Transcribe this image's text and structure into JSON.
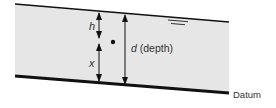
{
  "diagram": {
    "labels": {
      "h": "h",
      "x": "x",
      "d_symbol": "d",
      "d_text": " (depth)",
      "datum": "Datum"
    },
    "elements": {
      "water_surface_symbol": "free-surface-marker",
      "point": "point-in-flow"
    },
    "colors": {
      "fill": "#e6e6e6",
      "line": "#111111",
      "text": "#333333"
    }
  }
}
